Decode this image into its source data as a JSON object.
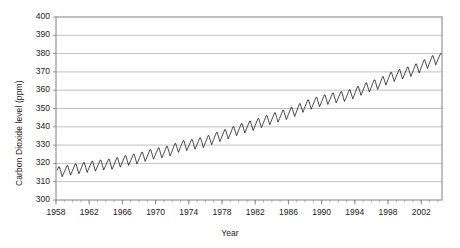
{
  "chart_data": {
    "type": "line",
    "title": "",
    "xlabel": "Year",
    "ylabel": "Carbon Dioxide level (ppm)",
    "xlim": [
      1958,
      2004.5
    ],
    "ylim": [
      300,
      400
    ],
    "ytick_labels": [
      "400",
      "390",
      "380",
      "370",
      "360",
      "350",
      "340",
      "330",
      "320",
      "310",
      "300"
    ],
    "ytick_values": [
      400,
      390,
      380,
      370,
      360,
      350,
      340,
      330,
      320,
      310,
      300
    ],
    "xtick_labels": [
      "1958",
      "1962",
      "1966",
      "1970",
      "1974",
      "1978",
      "1982",
      "1986",
      "1990",
      "1994",
      "1998",
      "2002"
    ],
    "xtick_values": [
      1958,
      1962,
      1966,
      1970,
      1974,
      1978,
      1982,
      1986,
      1990,
      1994,
      1998,
      2002
    ],
    "minor_xtick_step": 1,
    "grid": "horizontal",
    "line_color": "#222222",
    "grid_color": "#b0b0b0",
    "border_color": "#808080",
    "series": [
      {
        "name": "Atmospheric CO2 (Mauna Loa, monthly mean)",
        "seasonal_amplitude_ppm": 6.2,
        "annual_means": [
          {
            "year": 1958,
            "value": 315.3
          },
          {
            "year": 1959,
            "value": 316.0
          },
          {
            "year": 1960,
            "value": 316.9
          },
          {
            "year": 1961,
            "value": 317.6
          },
          {
            "year": 1962,
            "value": 318.4
          },
          {
            "year": 1963,
            "value": 319.0
          },
          {
            "year": 1964,
            "value": 319.6
          },
          {
            "year": 1965,
            "value": 320.0
          },
          {
            "year": 1966,
            "value": 321.4
          },
          {
            "year": 1967,
            "value": 322.2
          },
          {
            "year": 1968,
            "value": 323.0
          },
          {
            "year": 1969,
            "value": 324.6
          },
          {
            "year": 1970,
            "value": 325.7
          },
          {
            "year": 1971,
            "value": 326.3
          },
          {
            "year": 1972,
            "value": 327.5
          },
          {
            "year": 1973,
            "value": 329.7
          },
          {
            "year": 1974,
            "value": 330.2
          },
          {
            "year": 1975,
            "value": 331.1
          },
          {
            "year": 1976,
            "value": 332.0
          },
          {
            "year": 1977,
            "value": 333.8
          },
          {
            "year": 1978,
            "value": 335.4
          },
          {
            "year": 1979,
            "value": 336.8
          },
          {
            "year": 1980,
            "value": 338.7
          },
          {
            "year": 1981,
            "value": 340.1
          },
          {
            "year": 1982,
            "value": 341.4
          },
          {
            "year": 1983,
            "value": 343.0
          },
          {
            "year": 1984,
            "value": 344.6
          },
          {
            "year": 1985,
            "value": 346.0
          },
          {
            "year": 1986,
            "value": 347.4
          },
          {
            "year": 1987,
            "value": 349.2
          },
          {
            "year": 1988,
            "value": 351.6
          },
          {
            "year": 1989,
            "value": 353.1
          },
          {
            "year": 1990,
            "value": 354.4
          },
          {
            "year": 1991,
            "value": 355.6
          },
          {
            "year": 1992,
            "value": 356.4
          },
          {
            "year": 1993,
            "value": 357.1
          },
          {
            "year": 1994,
            "value": 358.8
          },
          {
            "year": 1995,
            "value": 360.8
          },
          {
            "year": 1996,
            "value": 362.6
          },
          {
            "year": 1997,
            "value": 363.8
          },
          {
            "year": 1998,
            "value": 366.6
          },
          {
            "year": 1999,
            "value": 368.3
          },
          {
            "year": 2000,
            "value": 369.5
          },
          {
            "year": 2001,
            "value": 371.0
          },
          {
            "year": 2002,
            "value": 373.1
          },
          {
            "year": 2003,
            "value": 375.6
          },
          {
            "year": 2004,
            "value": 377.4
          }
        ]
      }
    ]
  }
}
